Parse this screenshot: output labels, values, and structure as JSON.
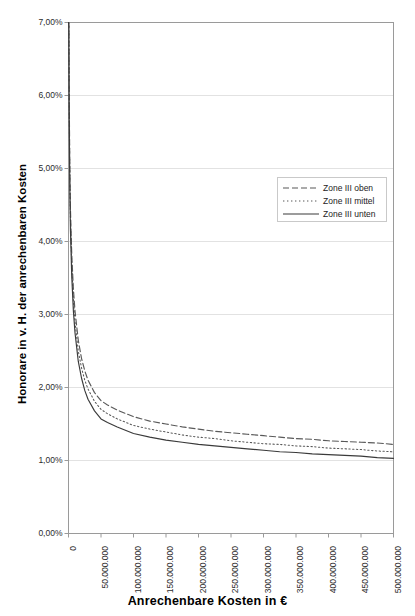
{
  "chart_data": {
    "type": "line",
    "title": "",
    "xlabel": "Anrechenbare Kosten in €",
    "ylabel": "Honorare in v. H. der anrechenbaren Kosten",
    "xlim": [
      0,
      500000000
    ],
    "ylim": [
      0,
      7
    ],
    "grid": true,
    "y_unit": "%",
    "y_tick_labels": [
      "0,00%",
      "1,00%",
      "2,00%",
      "3,00%",
      "4,00%",
      "5,00%",
      "6,00%",
      "7,00%"
    ],
    "y_tick_values": [
      0,
      1,
      2,
      3,
      4,
      5,
      6,
      7
    ],
    "x_tick_labels": [
      "0",
      "50.000.000",
      "100.000.000",
      "150.000.000",
      "200.000.000",
      "250.000.000",
      "300.000.000",
      "350.000.000",
      "400.000.000",
      "450.000.000",
      "500.000.000"
    ],
    "x_tick_values": [
      0,
      50000000,
      100000000,
      150000000,
      200000000,
      250000000,
      300000000,
      350000000,
      400000000,
      450000000,
      500000000
    ],
    "legend_position": "upper-right",
    "x": [
      500000,
      1000000,
      2000000,
      3000000,
      5000000,
      7500000,
      10000000,
      15000000,
      20000000,
      25000000,
      30000000,
      40000000,
      50000000,
      60000000,
      75000000,
      100000000,
      125000000,
      150000000,
      175000000,
      200000000,
      225000000,
      250000000,
      275000000,
      300000000,
      325000000,
      350000000,
      375000000,
      400000000,
      425000000,
      450000000,
      475000000,
      500000000
    ],
    "series": [
      {
        "name": "Zone III oben",
        "style": "dashed",
        "color": "#595959",
        "values": [
          7.25,
          6.1,
          5.02,
          4.45,
          3.82,
          3.35,
          3.05,
          2.65,
          2.4,
          2.23,
          2.1,
          1.93,
          1.82,
          1.76,
          1.69,
          1.6,
          1.54,
          1.5,
          1.46,
          1.43,
          1.4,
          1.38,
          1.36,
          1.34,
          1.32,
          1.3,
          1.29,
          1.27,
          1.26,
          1.25,
          1.24,
          1.22
        ]
      },
      {
        "name": "Zone III mittel",
        "style": "dotted",
        "color": "#595959",
        "values": [
          7.1,
          5.95,
          4.88,
          4.3,
          3.68,
          3.2,
          2.9,
          2.5,
          2.27,
          2.1,
          1.98,
          1.81,
          1.7,
          1.64,
          1.57,
          1.48,
          1.43,
          1.39,
          1.35,
          1.32,
          1.3,
          1.27,
          1.25,
          1.23,
          1.22,
          1.2,
          1.19,
          1.17,
          1.16,
          1.15,
          1.13,
          1.12
        ]
      },
      {
        "name": "Zone III unten",
        "style": "solid",
        "color": "#3a3a3a",
        "values": [
          6.95,
          5.8,
          4.72,
          4.15,
          3.52,
          3.05,
          2.75,
          2.36,
          2.13,
          1.96,
          1.84,
          1.68,
          1.57,
          1.52,
          1.46,
          1.37,
          1.32,
          1.28,
          1.25,
          1.22,
          1.2,
          1.18,
          1.16,
          1.14,
          1.12,
          1.11,
          1.09,
          1.08,
          1.07,
          1.06,
          1.04,
          1.03
        ]
      }
    ]
  },
  "legend": {
    "entries": [
      {
        "label": "Zone III oben"
      },
      {
        "label": "Zone III mittel"
      },
      {
        "label": "Zone III unten"
      }
    ]
  },
  "axes": {
    "x_title": "Anrechenbare Kosten in €",
    "y_title": "Honorare in v. H. der anrechenbaren Kosten"
  },
  "colors": {
    "plot_border": "#9a9a9a",
    "gridline": "#e2e2e2",
    "text": "#2b2b2b",
    "background": "#ffffff"
  }
}
